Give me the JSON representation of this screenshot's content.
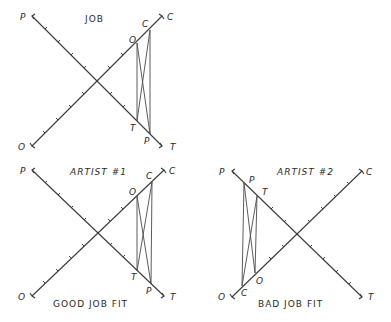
{
  "panels": [
    {
      "id": "job",
      "title": "JOB",
      "caption": "",
      "axes": {
        "end_labels": {
          "p_end": "P",
          "c_end": "C",
          "o_end": "O",
          "t_end": "T"
        }
      },
      "profile_points": {
        "o": "O",
        "c": "C",
        "t": "T",
        "p": "P"
      }
    },
    {
      "id": "artist-1",
      "title": "ARTIST #1",
      "caption": "GOOD JOB FIT",
      "axes": {
        "end_labels": {
          "p_end": "P",
          "c_end": "C",
          "o_end": "O",
          "t_end": "T"
        }
      },
      "profile_points": {
        "o": "O",
        "c": "C",
        "t": "T",
        "p": "P"
      }
    },
    {
      "id": "artist-2",
      "title": "ARTIST #2",
      "caption": "BAD JOB FIT",
      "axes": {
        "end_labels": {
          "p_end": "P",
          "c_end": "C",
          "o_end": "O",
          "t_end": "T"
        }
      },
      "profile_points": {
        "p": "P",
        "t": "T",
        "c": "C",
        "o": "O"
      }
    }
  ]
}
